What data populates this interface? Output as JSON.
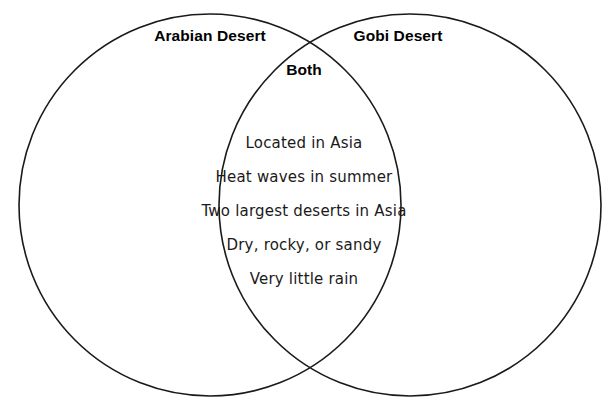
{
  "diagram": {
    "type": "venn-diagram",
    "sets": 2,
    "background_color": "#ffffff",
    "stroke_color": "#1a1a1a",
    "left_set": {
      "title": "Arabian Desert",
      "unique_items": []
    },
    "right_set": {
      "title": "Gobi Desert",
      "unique_items": []
    },
    "intersection": {
      "title": "Both",
      "items": [
        "Located in Asia",
        "Heat waves in summer",
        "Two largest deserts in Asia",
        "Dry, rocky, or sandy",
        "Very little rain"
      ]
    },
    "geometry": {
      "left_circle": {
        "cx": 210,
        "cy": 205,
        "r": 191
      },
      "right_circle": {
        "cx": 410,
        "cy": 205,
        "r": 191
      }
    }
  }
}
